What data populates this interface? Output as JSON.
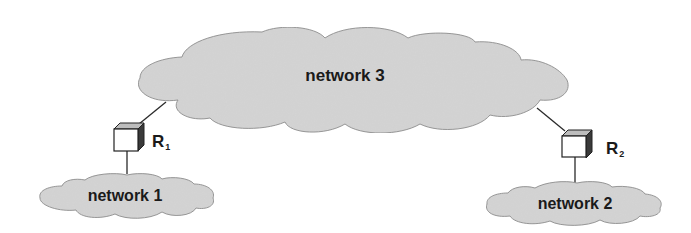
{
  "diagram": {
    "networks": [
      {
        "id": "network-3",
        "label": "network 3"
      },
      {
        "id": "network-1",
        "label": "network 1"
      },
      {
        "id": "network-2",
        "label": "network 2"
      }
    ],
    "routers": [
      {
        "id": "R1",
        "label": "R",
        "subscript": "1",
        "connects": [
          "network 3",
          "network 1"
        ]
      },
      {
        "id": "R2",
        "label": "R",
        "subscript": "2",
        "connects": [
          "network 3",
          "network 2"
        ]
      }
    ],
    "colors": {
      "cloud_fill": "#d4d4d4",
      "cloud_stroke": "#8a8a8a",
      "line": "#2a2a2a",
      "router_face": "#ffffff",
      "router_top": "#bdbdbd",
      "router_side": "#3a3a3a",
      "text": "#1a1a1a"
    }
  }
}
